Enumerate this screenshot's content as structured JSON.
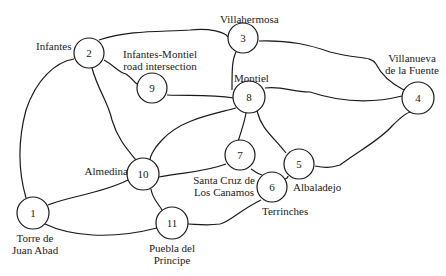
{
  "diagram": {
    "type": "road network graph",
    "nodes": [
      {
        "id": "1",
        "name": "Torre de Juan Abad",
        "lines": [
          "Torre de",
          "Juan Abad"
        ]
      },
      {
        "id": "2",
        "name": "Infantes",
        "lines": [
          "Infantes"
        ]
      },
      {
        "id": "3",
        "name": "Villahermosa",
        "lines": [
          "Villahermosa"
        ]
      },
      {
        "id": "4",
        "name": "Villanueva de la Fuente",
        "lines": [
          "Villanueva",
          "de la Fuente"
        ]
      },
      {
        "id": "5",
        "name": "Albaladejo",
        "lines": [
          "Albaladejo"
        ]
      },
      {
        "id": "6",
        "name": "Terrinches",
        "lines": [
          "Terrinches"
        ]
      },
      {
        "id": "7",
        "name": "Santa Cruz de Los Canamos",
        "lines": [
          "Santa Cruz de",
          "Los Canamos"
        ]
      },
      {
        "id": "8",
        "name": "Montiel",
        "lines": [
          "Montiel"
        ]
      },
      {
        "id": "9",
        "name": "Infantes-Montiel road intersection",
        "lines": [
          "Infantes-Montiel",
          "road intersection"
        ]
      },
      {
        "id": "10",
        "name": "Almedina",
        "lines": [
          "Almedina"
        ]
      },
      {
        "id": "11",
        "name": "Puebla del Principe",
        "lines": [
          "Puebla del",
          "Principe"
        ]
      }
    ],
    "edges": [
      [
        "1",
        "2"
      ],
      [
        "1",
        "10"
      ],
      [
        "1",
        "11"
      ],
      [
        "2",
        "3"
      ],
      [
        "2",
        "9"
      ],
      [
        "2",
        "10"
      ],
      [
        "9",
        "8"
      ],
      [
        "3",
        "8"
      ],
      [
        "3",
        "4"
      ],
      [
        "8",
        "4"
      ],
      [
        "8",
        "10"
      ],
      [
        "8",
        "7"
      ],
      [
        "8",
        "5"
      ],
      [
        "10",
        "7"
      ],
      [
        "10",
        "11"
      ],
      [
        "7",
        "6"
      ],
      [
        "6",
        "5"
      ],
      [
        "6",
        "11"
      ],
      [
        "5",
        "4"
      ]
    ]
  }
}
